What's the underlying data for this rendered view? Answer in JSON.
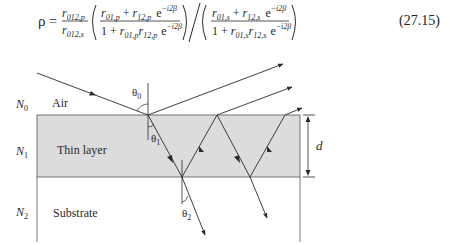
{
  "equation": {
    "lhs": "ρ",
    "prefactor": {
      "num_base": "r",
      "num_sub": "012,p",
      "den_base": "r",
      "den_sub": "012,s"
    },
    "p_fraction": {
      "num": {
        "a": "r",
        "a_sub": "01,p",
        "plus": "+",
        "b": "r",
        "b_sub": "12,p",
        "exp_base": "e",
        "exp": "−i2β"
      },
      "den": {
        "one": "1",
        "plus": "+",
        "a": "r",
        "a_sub": "01,p",
        "b": "r",
        "b_sub": "12,p",
        "exp_base": "e",
        "exp": "−i2β"
      }
    },
    "s_fraction": {
      "num": {
        "a": "r",
        "a_sub": "01,s",
        "plus": "+",
        "b": "r",
        "b_sub": "12,s",
        "exp_base": "e",
        "exp": "−i2β"
      },
      "den": {
        "one": "1",
        "plus": "+",
        "a": "r",
        "a_sub": "01,s",
        "b": "r",
        "b_sub": "12,s",
        "exp_base": "e",
        "exp": "−i2β"
      }
    },
    "number": "(27.15)"
  },
  "diagram": {
    "media": [
      {
        "index_label": "N",
        "index_sub": "0",
        "name": "Air"
      },
      {
        "index_label": "N",
        "index_sub": "1",
        "name": "Thin layer"
      },
      {
        "index_label": "N",
        "index_sub": "2",
        "name": "Substrate"
      }
    ],
    "angles": [
      {
        "symbol": "θ",
        "sub": "0"
      },
      {
        "symbol": "θ",
        "sub": "1"
      },
      {
        "symbol": "θ",
        "sub": "2"
      }
    ],
    "thickness_label": "d",
    "colors": {
      "layer_fill": "#dcdcdc",
      "line": "#2a2a2a",
      "surface": "#555555"
    }
  }
}
